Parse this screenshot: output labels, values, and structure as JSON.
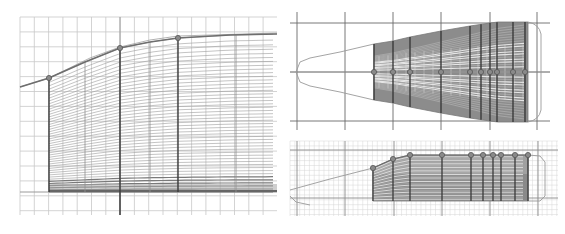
{
  "figure": {
    "colors": {
      "grid": "#c8c8c8",
      "grid_fine": "#d6d6d6",
      "grid_major": "#9a9a9a",
      "station": "#3a3a3a",
      "waterline": "#8a8a8a",
      "fill": "#8c8c8c",
      "outline": "#9a9a9a",
      "marker": "#555555"
    }
  },
  "left_view": {
    "name": "side-profile-view",
    "grid": {
      "x0": 20,
      "x1": 277,
      "dx": 14.3,
      "y0": 17,
      "y1": 215,
      "dy": 14.9
    },
    "axis_y": 192,
    "axis_x": 120,
    "body_x0": 49,
    "body_x1": 277,
    "bottom_y": 192,
    "top_curve": [
      [
        20,
        87
      ],
      [
        49,
        78
      ],
      [
        85,
        62
      ],
      [
        120,
        48
      ],
      [
        150,
        42
      ],
      [
        178,
        38
      ],
      [
        230,
        35
      ],
      [
        277,
        34
      ]
    ],
    "guide_curve": [
      [
        20,
        87
      ],
      [
        49,
        78
      ],
      [
        90,
        58
      ],
      [
        120,
        47
      ],
      [
        150,
        40
      ],
      [
        178,
        36
      ],
      [
        277,
        33
      ]
    ],
    "stations": [
      49,
      120,
      178
    ],
    "light_stations": [
      85,
      150,
      236
    ],
    "markers": [
      [
        49,
        78
      ],
      [
        120,
        48
      ],
      [
        178,
        38
      ]
    ],
    "waterline_count": 46
  },
  "top_right_view": {
    "name": "plan-view",
    "major_x": [
      297,
      345,
      393,
      441,
      490,
      537
    ],
    "major_y": [
      23,
      72,
      121
    ],
    "frame": {
      "x0": 290,
      "x1": 550,
      "y0": 12,
      "y1": 130
    },
    "center_y": 72,
    "nose_x": 296,
    "body_x0": 374,
    "body_x1": 528,
    "cap_x": 541,
    "half_width_curve": [
      [
        374,
        28
      ],
      [
        393,
        31
      ],
      [
        410,
        35
      ],
      [
        441,
        41
      ],
      [
        470,
        46
      ],
      [
        490,
        49
      ],
      [
        498,
        50
      ],
      [
        528,
        50
      ]
    ],
    "nose_curve": [
      [
        296,
        72
      ],
      [
        300,
        62
      ],
      [
        310,
        58
      ],
      [
        340,
        52
      ],
      [
        374,
        44
      ]
    ],
    "stations": [
      374,
      393,
      410,
      441,
      470,
      481,
      490,
      497,
      513,
      525
    ],
    "markers_y": 72
  },
  "bottom_right_view": {
    "name": "side-elevation-view",
    "frame": {
      "x0": 290,
      "x1": 558,
      "y0": 141,
      "y1": 216
    },
    "fine_dx": 4.85,
    "fine_dy": 4.9,
    "major_x": [
      297,
      345,
      394,
      442,
      490,
      538
    ],
    "major_y": [
      150,
      198
    ],
    "bottom_y": 201,
    "body_x0": 373,
    "body_x1": 528,
    "top_curve": [
      [
        373,
        168
      ],
      [
        393,
        159
      ],
      [
        410,
        155
      ],
      [
        442,
        155
      ],
      [
        528,
        155
      ]
    ],
    "guide_curve": [
      [
        290,
        190
      ],
      [
        330,
        179
      ],
      [
        373,
        168
      ]
    ],
    "keel_curve": [
      [
        290,
        196
      ],
      [
        296,
        202
      ],
      [
        310,
        205
      ]
    ],
    "cap": [
      [
        528,
        155
      ],
      [
        540,
        156
      ],
      [
        545,
        162
      ],
      [
        545,
        196
      ],
      [
        540,
        201
      ],
      [
        528,
        201
      ]
    ],
    "stations": [
      373,
      393,
      410,
      442,
      471,
      483,
      493,
      501,
      515,
      528
    ],
    "dense_band": {
      "y0": 174,
      "y1": 201
    }
  }
}
